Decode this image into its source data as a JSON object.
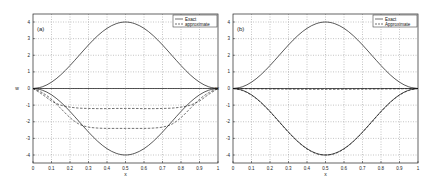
{
  "chart_data": [
    {
      "type": "line",
      "panel_label": "(a)",
      "xlabel": "x",
      "ylabel": "w",
      "xlim": [
        0,
        1
      ],
      "ylim": [
        -4.5,
        4.5
      ],
      "xticks": [
        "0",
        "0.1",
        "0.2",
        "0.3",
        "0.4",
        "0.5",
        "0.6",
        "0.7",
        "0.8",
        "0.9",
        "1"
      ],
      "yticks": [
        "4",
        "3",
        "2",
        "1",
        "0",
        "-1",
        "-2",
        "-3",
        "-4"
      ],
      "grid": true,
      "legend": {
        "position": "upper right",
        "entries": [
          {
            "label": "Exact",
            "style": "solid"
          },
          {
            "label": "approximate",
            "style": "dashed"
          }
        ]
      },
      "series": [
        {
          "name": "Exact (upper)",
          "style": "solid",
          "x": [
            0,
            0.05,
            0.1,
            0.15,
            0.2,
            0.25,
            0.3,
            0.35,
            0.4,
            0.45,
            0.5,
            0.55,
            0.6,
            0.65,
            0.7,
            0.75,
            0.8,
            0.85,
            0.9,
            0.95,
            1
          ],
          "values": [
            0,
            0.1,
            0.38,
            0.82,
            1.38,
            2.0,
            2.62,
            3.18,
            3.62,
            3.9,
            4.0,
            3.9,
            3.62,
            3.18,
            2.62,
            2.0,
            1.38,
            0.82,
            0.38,
            0.1,
            0
          ]
        },
        {
          "name": "Exact (lower)",
          "style": "solid",
          "x": [
            0,
            0.05,
            0.1,
            0.15,
            0.2,
            0.25,
            0.3,
            0.35,
            0.4,
            0.45,
            0.5,
            0.55,
            0.6,
            0.65,
            0.7,
            0.75,
            0.8,
            0.85,
            0.9,
            0.95,
            1
          ],
          "values": [
            0,
            -0.1,
            -0.38,
            -0.82,
            -1.38,
            -2.0,
            -2.62,
            -3.18,
            -3.62,
            -3.9,
            -4.0,
            -3.9,
            -3.62,
            -3.18,
            -2.62,
            -2.0,
            -1.38,
            -0.82,
            -0.38,
            -0.1,
            0
          ]
        },
        {
          "name": "Exact (zero)",
          "style": "solid",
          "x": [
            0,
            1
          ],
          "values": [
            0,
            0
          ]
        },
        {
          "name": "approximate 1",
          "style": "dashed",
          "x": [
            0,
            0.05,
            0.1,
            0.15,
            0.2,
            0.25,
            0.3,
            0.35,
            0.4,
            0.45,
            0.5,
            0.55,
            0.6,
            0.65,
            0.7,
            0.75,
            0.8,
            0.85,
            0.9,
            0.95,
            1
          ],
          "values": [
            0,
            -0.35,
            -0.75,
            -1.0,
            -1.12,
            -1.18,
            -1.2,
            -1.21,
            -1.21,
            -1.2,
            -1.2,
            -1.2,
            -1.21,
            -1.21,
            -1.2,
            -1.18,
            -1.12,
            -1.0,
            -0.75,
            -0.35,
            0
          ]
        },
        {
          "name": "approximate 2",
          "style": "dashed",
          "x": [
            0,
            0.05,
            0.1,
            0.15,
            0.2,
            0.25,
            0.3,
            0.35,
            0.4,
            0.45,
            0.5,
            0.55,
            0.6,
            0.65,
            0.7,
            0.75,
            0.8,
            0.85,
            0.9,
            0.95,
            1
          ],
          "values": [
            0,
            -0.25,
            -0.65,
            -1.2,
            -1.75,
            -2.15,
            -2.32,
            -2.38,
            -2.4,
            -2.4,
            -2.4,
            -2.4,
            -2.4,
            -2.38,
            -2.32,
            -2.15,
            -1.75,
            -1.2,
            -0.65,
            -0.25,
            0
          ]
        }
      ]
    },
    {
      "type": "line",
      "panel_label": "(b)",
      "xlabel": "x",
      "ylabel": "w",
      "xlim": [
        0,
        1
      ],
      "ylim": [
        -4.5,
        4.5
      ],
      "xticks": [
        "0",
        "0.1",
        "0.2",
        "0.3",
        "0.4",
        "0.5",
        "0.6",
        "0.7",
        "0.8",
        "0.9",
        "1"
      ],
      "yticks": [
        "4",
        "3",
        "2",
        "1",
        "0",
        "-1",
        "-2",
        "-3",
        "-4"
      ],
      "grid": true,
      "legend": {
        "position": "upper right",
        "entries": [
          {
            "label": "Exact",
            "style": "solid"
          },
          {
            "label": "Approximate",
            "style": "dashed"
          }
        ]
      },
      "series": [
        {
          "name": "Exact (upper)",
          "style": "solid",
          "x": [
            0,
            0.05,
            0.1,
            0.15,
            0.2,
            0.25,
            0.3,
            0.35,
            0.4,
            0.45,
            0.5,
            0.55,
            0.6,
            0.65,
            0.7,
            0.75,
            0.8,
            0.85,
            0.9,
            0.95,
            1
          ],
          "values": [
            0,
            0.1,
            0.38,
            0.82,
            1.38,
            2.0,
            2.62,
            3.18,
            3.62,
            3.9,
            4.0,
            3.9,
            3.62,
            3.18,
            2.62,
            2.0,
            1.38,
            0.82,
            0.38,
            0.1,
            0
          ]
        },
        {
          "name": "Exact (lower)",
          "style": "solid",
          "x": [
            0,
            0.05,
            0.1,
            0.15,
            0.2,
            0.25,
            0.3,
            0.35,
            0.4,
            0.45,
            0.5,
            0.55,
            0.6,
            0.65,
            0.7,
            0.75,
            0.8,
            0.85,
            0.9,
            0.95,
            1
          ],
          "values": [
            0,
            -0.1,
            -0.38,
            -0.82,
            -1.38,
            -2.0,
            -2.62,
            -3.18,
            -3.62,
            -3.9,
            -4.0,
            -3.9,
            -3.62,
            -3.18,
            -2.62,
            -2.0,
            -1.38,
            -0.82,
            -0.38,
            -0.1,
            0
          ]
        },
        {
          "name": "Exact (zero)",
          "style": "solid",
          "x": [
            0,
            1
          ],
          "values": [
            0,
            0
          ]
        },
        {
          "name": "approximate lower",
          "style": "dashed",
          "x": [
            0,
            0.05,
            0.1,
            0.15,
            0.2,
            0.25,
            0.3,
            0.35,
            0.4,
            0.45,
            0.5,
            0.55,
            0.6,
            0.65,
            0.7,
            0.75,
            0.8,
            0.85,
            0.9,
            0.95,
            1
          ],
          "values": [
            0,
            -0.12,
            -0.4,
            -0.84,
            -1.4,
            -2.02,
            -2.64,
            -3.2,
            -3.64,
            -3.92,
            -4.0,
            -3.92,
            -3.64,
            -3.2,
            -2.64,
            -2.02,
            -1.4,
            -0.84,
            -0.4,
            -0.12,
            0
          ]
        },
        {
          "name": "approximate zero",
          "style": "dashed",
          "x": [
            0,
            0.1,
            0.3,
            0.5,
            0.7,
            0.9,
            1
          ],
          "values": [
            0,
            -0.02,
            -0.04,
            -0.05,
            -0.04,
            -0.02,
            0
          ]
        }
      ]
    }
  ],
  "layout": {
    "panels": [
      {
        "frame": {
          "left": 33,
          "top": 14,
          "right": 218,
          "bottom": 163
        },
        "y4_px": 22,
        "yneg4_px": 155
      },
      {
        "frame": {
          "left": 233,
          "top": 14,
          "right": 418,
          "bottom": 163
        },
        "y4_px": 22,
        "yneg4_px": 155
      }
    ]
  }
}
